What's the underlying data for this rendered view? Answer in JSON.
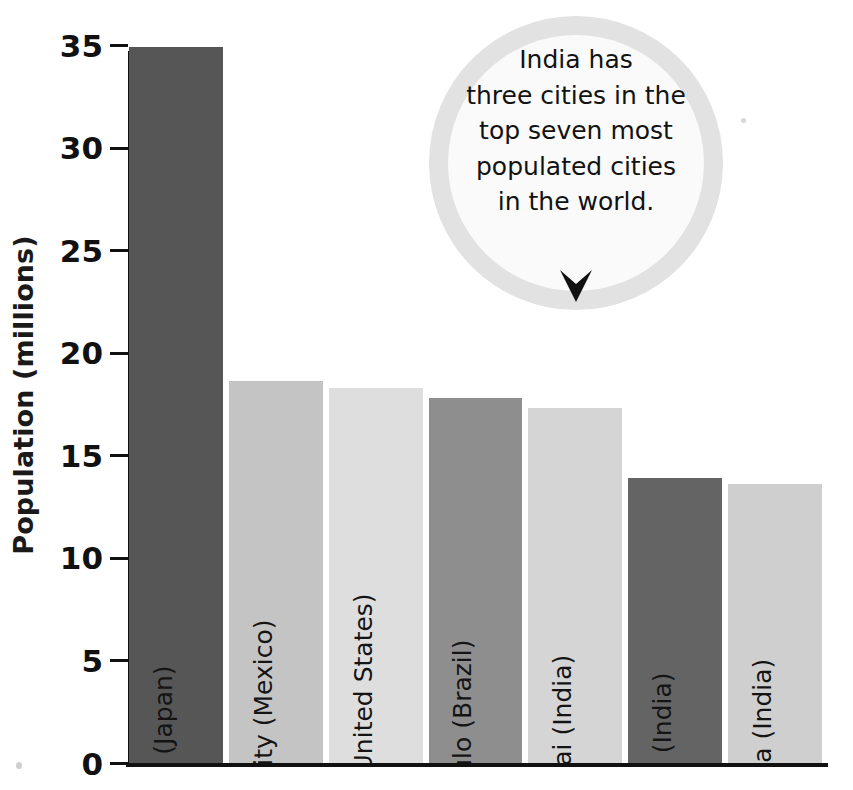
{
  "chart_data": {
    "type": "bar",
    "title": "",
    "xlabel": "",
    "ylabel": "Population (millions)",
    "ylim": [
      0,
      35
    ],
    "grid": false,
    "legend": "none",
    "categories": [
      "Tokyo (Japan)",
      "Mexico City (Mexico)",
      "New York (United States)",
      "São Paulo (Brazil)",
      "Mumbai (India)",
      "Delhi (India)",
      "Kolkata (India)"
    ],
    "values": [
      34.9,
      18.6,
      18.3,
      17.8,
      17.3,
      13.9,
      13.6
    ],
    "bar_colors": [
      "#565656",
      "#c4c4c4",
      "#dedede",
      "#8e8e8e",
      "#d5d5d5",
      "#646464",
      "#cfcfcf"
    ],
    "y_ticks": [
      0,
      5,
      10,
      15,
      20,
      25,
      30,
      35
    ],
    "y_tick_labels": [
      "0",
      "5",
      "10",
      "15",
      "20",
      "25",
      "30",
      "35"
    ],
    "annotations": [
      {
        "name": "india-callout",
        "lines": [
          "India has",
          "three cities in the",
          "top seven most",
          "populated cities",
          "in the world."
        ],
        "shape": "circle",
        "ring_color": "#e2e2e2",
        "fill_color": "#fafafa",
        "pointer": "down-chevron",
        "pointer_color": "#111111"
      }
    ]
  },
  "axis": {
    "y_title": "Population (millions)",
    "axis_color": "#111111"
  },
  "callout": {
    "line1": "India has",
    "line2": "three cities in the",
    "line3": "top seven most",
    "line4": "populated cities",
    "line5": "in the world."
  }
}
